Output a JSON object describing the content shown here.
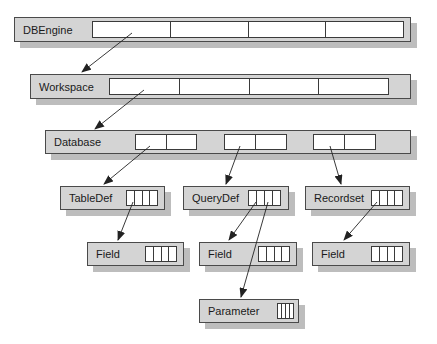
{
  "diagram": {
    "nodes": [
      {
        "id": "dbengine",
        "label": "DBEngine",
        "x": 14,
        "y": 17,
        "w": 397,
        "h": 25,
        "strips": [
          {
            "x": 92,
            "w": 312,
            "cells": 4
          }
        ]
      },
      {
        "id": "workspace",
        "label": "Workspace",
        "x": 30,
        "y": 74,
        "w": 381,
        "h": 25,
        "strips": [
          {
            "x": 109,
            "w": 280,
            "cells": 4
          }
        ]
      },
      {
        "id": "database",
        "label": "Database",
        "x": 45,
        "y": 130,
        "w": 366,
        "h": 24,
        "strips": [
          {
            "x": 135,
            "w": 62,
            "cells": 2
          },
          {
            "x": 224,
            "w": 63,
            "cells": 2
          },
          {
            "x": 313,
            "w": 63,
            "cells": 2
          }
        ]
      },
      {
        "id": "tabledef",
        "label": "TableDef",
        "x": 60,
        "y": 186,
        "w": 105,
        "h": 24,
        "strips": [
          {
            "x": 126,
            "w": 32,
            "cells": 4
          }
        ]
      },
      {
        "id": "querydef",
        "label": "QueryDef",
        "x": 183,
        "y": 186,
        "w": 106,
        "h": 24,
        "strips": [
          {
            "x": 248,
            "w": 33,
            "cells": 4
          }
        ]
      },
      {
        "id": "recordset",
        "label": "Recordset",
        "x": 305,
        "y": 186,
        "w": 105,
        "h": 24,
        "strips": [
          {
            "x": 371,
            "w": 32,
            "cells": 4
          }
        ]
      },
      {
        "id": "field-tabledef",
        "label": "Field",
        "x": 87,
        "y": 242,
        "w": 97,
        "h": 24,
        "strips": [
          {
            "x": 145,
            "w": 32,
            "cells": 4
          }
        ]
      },
      {
        "id": "field-querydef",
        "label": "Field",
        "x": 199,
        "y": 242,
        "w": 98,
        "h": 24,
        "strips": [
          {
            "x": 258,
            "w": 32,
            "cells": 4
          }
        ]
      },
      {
        "id": "field-recordset",
        "label": "Field",
        "x": 312,
        "y": 242,
        "w": 98,
        "h": 24,
        "strips": [
          {
            "x": 371,
            "w": 32,
            "cells": 4
          }
        ]
      },
      {
        "id": "parameter",
        "label": "Parameter",
        "x": 199,
        "y": 299,
        "w": 100,
        "h": 24,
        "strips": [
          {
            "x": 277,
            "w": 17,
            "cells": 4
          }
        ]
      }
    ],
    "edges": [
      {
        "from": "dbengine",
        "to": "workspace",
        "x1": 132,
        "y1": 33,
        "x2": 82,
        "y2": 72
      },
      {
        "from": "workspace",
        "to": "database",
        "x1": 144,
        "y1": 90,
        "x2": 95,
        "y2": 129
      },
      {
        "from": "database",
        "to": "tabledef",
        "x1": 150,
        "y1": 146,
        "x2": 104,
        "y2": 184
      },
      {
        "from": "database",
        "to": "querydef",
        "x1": 240,
        "y1": 146,
        "x2": 226,
        "y2": 184
      },
      {
        "from": "database",
        "to": "recordset",
        "x1": 330,
        "y1": 146,
        "x2": 341,
        "y2": 184
      },
      {
        "from": "tabledef",
        "to": "field-tabledef",
        "x1": 133,
        "y1": 202,
        "x2": 118,
        "y2": 240
      },
      {
        "from": "querydef",
        "to": "field-querydef",
        "x1": 256,
        "y1": 202,
        "x2": 229,
        "y2": 240
      },
      {
        "from": "querydef",
        "to": "parameter",
        "x1": 268,
        "y1": 202,
        "x2": 241,
        "y2": 297
      },
      {
        "from": "recordset",
        "to": "field-recordset",
        "x1": 377,
        "y1": 202,
        "x2": 344,
        "y2": 240
      }
    ],
    "colors": {
      "box_fill": "#d4d4d4",
      "box_border": "#4a4a4a",
      "shadow": "#bdbdbd",
      "strip_fill": "#ffffff",
      "line": "#222222"
    }
  }
}
